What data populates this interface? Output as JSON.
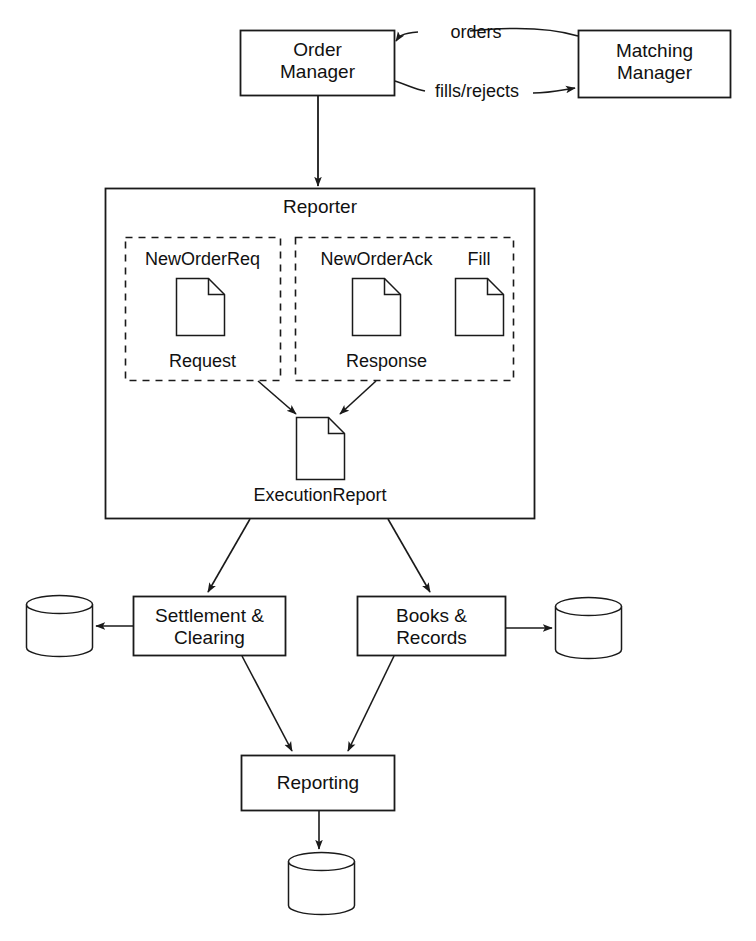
{
  "diagram": {
    "stroke_color": "#1a1a1a",
    "fill_color": "#ffffff",
    "nodes": {
      "order_manager": {
        "label": "Order\nManager",
        "shape": "rect"
      },
      "matching_manager": {
        "label": "Matching\nManager",
        "shape": "rect"
      },
      "reporter": {
        "label": "Reporter",
        "shape": "rect-container"
      },
      "request_group": {
        "label": "Request",
        "shape": "dashed-rect"
      },
      "response_group": {
        "label": "Response",
        "shape": "dashed-rect"
      },
      "new_order_req": {
        "label": "NewOrderReq",
        "shape": "document"
      },
      "new_order_ack": {
        "label": "NewOrderAck",
        "shape": "document"
      },
      "fill": {
        "label": "Fill",
        "shape": "document"
      },
      "execution_report": {
        "label": "ExecutionReport",
        "shape": "document"
      },
      "settlement_clearing": {
        "label": "Settlement &\nClearing",
        "shape": "rect"
      },
      "books_records": {
        "label": "Books &\nRecords",
        "shape": "rect"
      },
      "reporting": {
        "label": "Reporting",
        "shape": "rect"
      },
      "db_left": {
        "label": "",
        "shape": "cylinder"
      },
      "db_right": {
        "label": "",
        "shape": "cylinder"
      },
      "db_bottom": {
        "label": "",
        "shape": "cylinder"
      }
    },
    "edges": {
      "orders": {
        "label": "orders",
        "from": "matching_manager",
        "to": "order_manager"
      },
      "fills_rejects": {
        "label": "fills/rejects",
        "from": "order_manager",
        "to": "matching_manager"
      },
      "om_to_reporter": {
        "label": "",
        "from": "order_manager",
        "to": "reporter"
      },
      "request_to_exec": {
        "label": "",
        "from": "request_group",
        "to": "execution_report"
      },
      "response_to_exec": {
        "label": "",
        "from": "response_group",
        "to": "execution_report"
      },
      "reporter_to_settlement": {
        "label": "",
        "from": "reporter",
        "to": "settlement_clearing"
      },
      "reporter_to_books": {
        "label": "",
        "from": "reporter",
        "to": "books_records"
      },
      "settlement_to_db": {
        "label": "",
        "from": "settlement_clearing",
        "to": "db_left"
      },
      "books_to_db": {
        "label": "",
        "from": "books_records",
        "to": "db_right"
      },
      "settlement_to_reporting": {
        "label": "",
        "from": "settlement_clearing",
        "to": "reporting"
      },
      "books_to_reporting": {
        "label": "",
        "from": "books_records",
        "to": "reporting"
      },
      "reporting_to_db": {
        "label": "",
        "from": "reporting",
        "to": "db_bottom"
      }
    }
  }
}
